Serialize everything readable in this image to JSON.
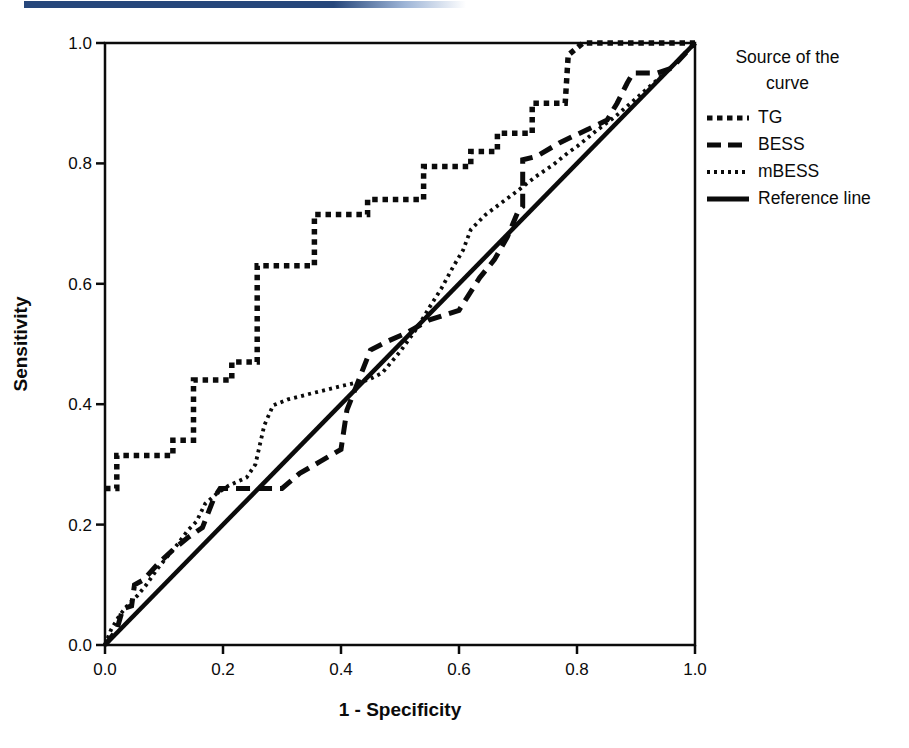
{
  "header": {
    "accent_bar_color": "#27477b"
  },
  "legend": {
    "title_line1": "Source of the",
    "title_line2": "curve"
  },
  "chart_data": {
    "type": "line",
    "title": "",
    "xlabel": "1 - Specificity",
    "ylabel": "Sensitivity",
    "xlim": [
      0.0,
      1.0
    ],
    "ylim": [
      0.0,
      1.0
    ],
    "grid": false,
    "legend_position": "right",
    "xticks": [
      "0.0",
      "0.2",
      "0.4",
      "0.6",
      "0.8",
      "1.0"
    ],
    "yticks": [
      "0.0",
      "0.2",
      "0.4",
      "0.6",
      "0.8",
      "1.0"
    ],
    "series": [
      {
        "name": "TG",
        "style": "coarse-dash",
        "points": [
          [
            0,
            0.26
          ],
          [
            0.02,
            0.26
          ],
          [
            0.02,
            0.315
          ],
          [
            0.115,
            0.315
          ],
          [
            0.115,
            0.34
          ],
          [
            0.15,
            0.34
          ],
          [
            0.15,
            0.44
          ],
          [
            0.215,
            0.44
          ],
          [
            0.215,
            0.47
          ],
          [
            0.258,
            0.47
          ],
          [
            0.258,
            0.63
          ],
          [
            0.355,
            0.63
          ],
          [
            0.355,
            0.715
          ],
          [
            0.445,
            0.715
          ],
          [
            0.445,
            0.74
          ],
          [
            0.54,
            0.74
          ],
          [
            0.54,
            0.795
          ],
          [
            0.62,
            0.795
          ],
          [
            0.62,
            0.82
          ],
          [
            0.665,
            0.82
          ],
          [
            0.665,
            0.85
          ],
          [
            0.724,
            0.85
          ],
          [
            0.724,
            0.9
          ],
          [
            0.78,
            0.9
          ],
          [
            0.785,
            0.98
          ],
          [
            0.81,
            1.0
          ],
          [
            1.0,
            1.0
          ]
        ]
      },
      {
        "name": "BESS",
        "style": "long-dash",
        "points": [
          [
            0,
            0
          ],
          [
            0.02,
            0.025
          ],
          [
            0.03,
            0.06
          ],
          [
            0.045,
            0.065
          ],
          [
            0.05,
            0.1
          ],
          [
            0.065,
            0.108
          ],
          [
            0.09,
            0.135
          ],
          [
            0.115,
            0.158
          ],
          [
            0.14,
            0.178
          ],
          [
            0.165,
            0.195
          ],
          [
            0.185,
            0.245
          ],
          [
            0.195,
            0.26
          ],
          [
            0.3,
            0.26
          ],
          [
            0.33,
            0.285
          ],
          [
            0.365,
            0.305
          ],
          [
            0.4,
            0.325
          ],
          [
            0.41,
            0.39
          ],
          [
            0.43,
            0.44
          ],
          [
            0.45,
            0.49
          ],
          [
            0.48,
            0.505
          ],
          [
            0.51,
            0.518
          ],
          [
            0.55,
            0.54
          ],
          [
            0.6,
            0.556
          ],
          [
            0.635,
            0.61
          ],
          [
            0.66,
            0.64
          ],
          [
            0.682,
            0.678
          ],
          [
            0.7,
            0.72
          ],
          [
            0.708,
            0.728
          ],
          [
            0.708,
            0.806
          ],
          [
            0.732,
            0.812
          ],
          [
            0.77,
            0.834
          ],
          [
            0.817,
            0.856
          ],
          [
            0.851,
            0.872
          ],
          [
            0.868,
            0.9
          ],
          [
            0.885,
            0.933
          ],
          [
            0.895,
            0.95
          ],
          [
            0.936,
            0.95
          ],
          [
            0.96,
            0.958
          ],
          [
            1.0,
            1.0
          ]
        ]
      },
      {
        "name": "mBESS",
        "style": "fine-dot",
        "points": [
          [
            0,
            0
          ],
          [
            0.01,
            0.025
          ],
          [
            0.025,
            0.05
          ],
          [
            0.04,
            0.068
          ],
          [
            0.055,
            0.082
          ],
          [
            0.07,
            0.1
          ],
          [
            0.09,
            0.128
          ],
          [
            0.11,
            0.152
          ],
          [
            0.125,
            0.17
          ],
          [
            0.14,
            0.19
          ],
          [
            0.155,
            0.205
          ],
          [
            0.17,
            0.235
          ],
          [
            0.19,
            0.252
          ],
          [
            0.21,
            0.265
          ],
          [
            0.24,
            0.278
          ],
          [
            0.255,
            0.3
          ],
          [
            0.27,
            0.365
          ],
          [
            0.285,
            0.398
          ],
          [
            0.31,
            0.408
          ],
          [
            0.35,
            0.418
          ],
          [
            0.4,
            0.43
          ],
          [
            0.445,
            0.44
          ],
          [
            0.47,
            0.452
          ],
          [
            0.5,
            0.487
          ],
          [
            0.53,
            0.528
          ],
          [
            0.55,
            0.561
          ],
          [
            0.57,
            0.592
          ],
          [
            0.59,
            0.628
          ],
          [
            0.607,
            0.656
          ],
          [
            0.62,
            0.69
          ],
          [
            0.645,
            0.715
          ],
          [
            0.67,
            0.733
          ],
          [
            0.7,
            0.755
          ],
          [
            0.73,
            0.778
          ],
          [
            0.76,
            0.798
          ],
          [
            0.785,
            0.818
          ],
          [
            0.8,
            0.828
          ],
          [
            0.83,
            0.852
          ],
          [
            0.865,
            0.878
          ],
          [
            0.9,
            0.908
          ],
          [
            0.935,
            0.938
          ],
          [
            0.965,
            0.965
          ],
          [
            1.0,
            1.0
          ]
        ]
      },
      {
        "name": "Reference line",
        "style": "solid",
        "points": [
          [
            0,
            0
          ],
          [
            1,
            1
          ]
        ]
      }
    ]
  }
}
